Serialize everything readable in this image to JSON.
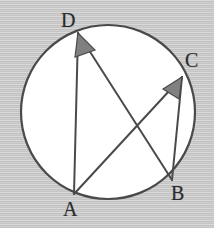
{
  "figure": {
    "kind": "circle-geometry-diagram",
    "background_color": "#c9c9c9",
    "circle_fill": "#ffffff",
    "stroke_color": "#4a4a4a",
    "angle_marker_fill": "#808080",
    "angle_marker_stroke": "#4a4a4a",
    "label_color": "#2b2b2b"
  },
  "circle": {
    "name": "main-circle",
    "cx": 108,
    "cy": 112,
    "r": 87,
    "stroke_width": 2.2
  },
  "points": [
    {
      "id": "A",
      "label": "A",
      "x": 74,
      "y": 194
    },
    {
      "id": "B",
      "label": "B",
      "x": 172,
      "y": 180
    },
    {
      "id": "C",
      "label": "C",
      "x": 182,
      "y": 77
    },
    {
      "id": "D",
      "label": "D",
      "x": 78,
      "y": 33
    }
  ],
  "chords": [
    {
      "name": "chord-DA",
      "from": "D",
      "to": "A",
      "x1": 78,
      "y1": 33,
      "x2": 74,
      "y2": 194
    },
    {
      "name": "chord-DB",
      "from": "D",
      "to": "B",
      "x1": 78,
      "y1": 33,
      "x2": 172,
      "y2": 180
    },
    {
      "name": "chord-AC",
      "from": "A",
      "to": "C",
      "x1": 74,
      "y1": 194,
      "x2": 182,
      "y2": 77
    },
    {
      "name": "chord-CB",
      "from": "C",
      "to": "B",
      "x1": 182,
      "y1": 77,
      "x2": 172,
      "y2": 180
    }
  ],
  "angle_markers": [
    {
      "name": "angle-marker-D",
      "at_vertex": "D",
      "between": [
        "A",
        "B"
      ],
      "polygon": "78,33 75,57 95,50",
      "fill": "#808080"
    },
    {
      "name": "angle-marker-C",
      "at_vertex": "C",
      "between": [
        "A",
        "B"
      ],
      "polygon": "182,77 163,89 179,99",
      "fill": "#808080"
    }
  ],
  "labels": {
    "A": "A",
    "B": "B",
    "C": "C",
    "D": "D"
  }
}
